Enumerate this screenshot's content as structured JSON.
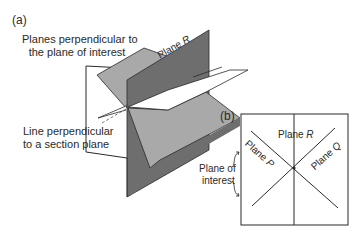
{
  "panel_a": {
    "label": "(a)",
    "annotation_top": [
      "Planes perpendicular to",
      "the plane of interest"
    ],
    "annotation_bottom": [
      "Line perpendicular",
      "to a section plane"
    ],
    "plane_r_label": "Plane",
    "plane_r_letter": "R"
  },
  "panel_b": {
    "label": "(b)",
    "plane_r_label": "Plane",
    "plane_r_letter": "R",
    "plane_p_label": "Plane",
    "plane_p_letter": "P",
    "plane_q_label": "Plane",
    "plane_q_letter": "Q",
    "plane_of_interest": [
      "Plane of",
      "interest"
    ]
  },
  "colors": {
    "dark_plane": "#6e6e6e",
    "light_plane": "#a9a9a9",
    "line": "#2a2a2a",
    "background": "#ffffff"
  }
}
